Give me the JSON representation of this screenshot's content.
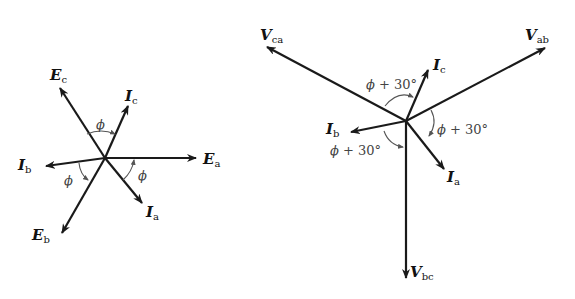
{
  "figure": {
    "left_diagram": {
      "title": "Phase voltages and line currents (Y-connection)",
      "vectors": [
        {
          "name": "E",
          "sub": "a"
        },
        {
          "name": "E",
          "sub": "b"
        },
        {
          "name": "E",
          "sub": "c"
        },
        {
          "name": "I",
          "sub": "a"
        },
        {
          "name": "I",
          "sub": "b"
        },
        {
          "name": "I",
          "sub": "c"
        }
      ],
      "angles": [
        "ϕ",
        "ϕ",
        "ϕ"
      ]
    },
    "right_diagram": {
      "title": "Line voltages and line currents",
      "vectors": [
        {
          "name": "V",
          "sub": "ab"
        },
        {
          "name": "V",
          "sub": "bc"
        },
        {
          "name": "V",
          "sub": "ca"
        },
        {
          "name": "I",
          "sub": "a"
        },
        {
          "name": "I",
          "sub": "b"
        },
        {
          "name": "I",
          "sub": "c"
        }
      ],
      "angles": [
        {
          "sym": "ϕ",
          "rest": " + 30°"
        },
        {
          "sym": "ϕ",
          "rest": " + 30°"
        },
        {
          "sym": "ϕ",
          "rest": " + 30°"
        }
      ]
    }
  }
}
